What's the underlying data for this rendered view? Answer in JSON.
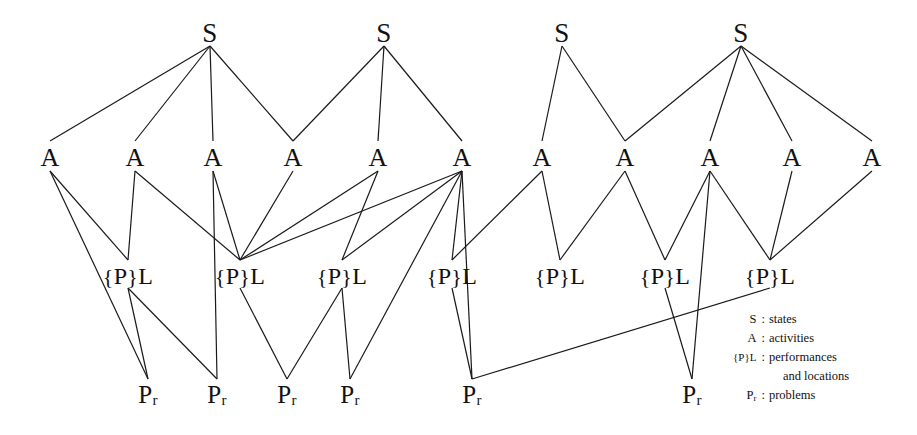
{
  "diagram": {
    "title": "",
    "background": "#ffffff",
    "line_color": "#1a1a1a",
    "text_color": "#111111",
    "levels": [
      {
        "id": "S",
        "label": "S",
        "y": 33
      },
      {
        "id": "A",
        "label": "A",
        "y": 158
      },
      {
        "id": "PL",
        "label": "{P}L",
        "y": 276
      },
      {
        "id": "Pr",
        "label": "Pr",
        "y": 395
      }
    ],
    "nodes": {
      "S": [
        {
          "id": "S1",
          "label": "S",
          "x": 210,
          "y": 33
        },
        {
          "id": "S2",
          "label": "S",
          "x": 384,
          "y": 33
        },
        {
          "id": "S3",
          "label": "S",
          "x": 562,
          "y": 33
        },
        {
          "id": "S4",
          "label": "S",
          "x": 741,
          "y": 33
        }
      ],
      "A": [
        {
          "id": "A1",
          "label": "A",
          "x": 50,
          "y": 158
        },
        {
          "id": "A2",
          "label": "A",
          "x": 135,
          "y": 158
        },
        {
          "id": "A3",
          "label": "A",
          "x": 213,
          "y": 158
        },
        {
          "id": "A4",
          "label": "A",
          "x": 293,
          "y": 158
        },
        {
          "id": "A5",
          "label": "A",
          "x": 378,
          "y": 158
        },
        {
          "id": "A6",
          "label": "A",
          "x": 462,
          "y": 158
        },
        {
          "id": "A7",
          "label": "A",
          "x": 542,
          "y": 158
        },
        {
          "id": "A8",
          "label": "A",
          "x": 625,
          "y": 158
        },
        {
          "id": "A9",
          "label": "A",
          "x": 710,
          "y": 158
        },
        {
          "id": "A10",
          "label": "A",
          "x": 792,
          "y": 158
        },
        {
          "id": "A11",
          "label": "A",
          "x": 872,
          "y": 158
        }
      ],
      "PL": [
        {
          "id": "PL1",
          "label": "{P}L",
          "x": 128,
          "y": 276
        },
        {
          "id": "PL2",
          "label": "{P}L",
          "x": 240,
          "y": 276
        },
        {
          "id": "PL3",
          "label": "{P}L",
          "x": 342,
          "y": 276
        },
        {
          "id": "PL4",
          "label": "{P}L",
          "x": 452,
          "y": 276
        },
        {
          "id": "PL5",
          "label": "{P}L",
          "x": 560,
          "y": 276
        },
        {
          "id": "PL6",
          "label": "{P}L",
          "x": 665,
          "y": 276
        },
        {
          "id": "PL7",
          "label": "{P}L",
          "x": 770,
          "y": 276
        }
      ],
      "Pr": [
        {
          "id": "Pr1",
          "label": "Pr",
          "x": 148,
          "y": 395
        },
        {
          "id": "Pr2",
          "label": "Pr",
          "x": 217,
          "y": 395
        },
        {
          "id": "Pr3",
          "label": "Pr",
          "x": 287,
          "y": 395
        },
        {
          "id": "Pr4",
          "label": "Pr",
          "x": 350,
          "y": 395
        },
        {
          "id": "Pr5",
          "label": "Pr",
          "x": 472,
          "y": 395
        },
        {
          "id": "Pr6",
          "label": "Pr",
          "x": 692,
          "y": 395
        }
      ]
    },
    "edges": [
      [
        "S1",
        "A1"
      ],
      [
        "S1",
        "A2"
      ],
      [
        "S1",
        "A3"
      ],
      [
        "S1",
        "A4"
      ],
      [
        "S2",
        "A4"
      ],
      [
        "S2",
        "A5"
      ],
      [
        "S2",
        "A6"
      ],
      [
        "S3",
        "A7"
      ],
      [
        "S3",
        "A8"
      ],
      [
        "S4",
        "A8"
      ],
      [
        "S4",
        "A9"
      ],
      [
        "S4",
        "A10"
      ],
      [
        "S4",
        "A11"
      ],
      [
        "A1",
        "PL1"
      ],
      [
        "A1",
        "Pr1"
      ],
      [
        "A2",
        "PL1"
      ],
      [
        "A2",
        "PL2"
      ],
      [
        "A3",
        "PL2"
      ],
      [
        "A3",
        "Pr2"
      ],
      [
        "A4",
        "PL2"
      ],
      [
        "A5",
        "PL2"
      ],
      [
        "A5",
        "PL3"
      ],
      [
        "A6",
        "PL2"
      ],
      [
        "A6",
        "PL3"
      ],
      [
        "A6",
        "PL4"
      ],
      [
        "A6",
        "Pr4"
      ],
      [
        "A6",
        "Pr5"
      ],
      [
        "A7",
        "PL5"
      ],
      [
        "A7",
        "PL4"
      ],
      [
        "A8",
        "PL5"
      ],
      [
        "A8",
        "PL6"
      ],
      [
        "A9",
        "PL6"
      ],
      [
        "A9",
        "Pr6"
      ],
      [
        "A9",
        "PL7"
      ],
      [
        "A10",
        "PL7"
      ],
      [
        "A11",
        "PL7"
      ],
      [
        "PL1",
        "Pr1"
      ],
      [
        "PL1",
        "Pr2"
      ],
      [
        "PL2",
        "Pr3"
      ],
      [
        "PL3",
        "Pr3"
      ],
      [
        "PL3",
        "Pr4"
      ],
      [
        "PL4",
        "Pr5"
      ],
      [
        "PL6",
        "Pr6"
      ],
      [
        "PL7",
        "Pr5"
      ]
    ]
  },
  "legend": {
    "rows": [
      {
        "symbol": "S",
        "colon": ":",
        "description": "states"
      },
      {
        "symbol": "A",
        "colon": ":",
        "description": "activities"
      },
      {
        "symbol": "{P}L",
        "colon": ":",
        "description": "performances"
      },
      {
        "symbol": "",
        "colon": "",
        "description": "and locations"
      },
      {
        "symbol": "Pr",
        "colon": ":",
        "description": "problems"
      }
    ]
  }
}
